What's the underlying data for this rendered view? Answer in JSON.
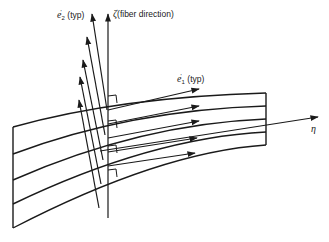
{
  "figure": {
    "type": "laminate fiber-coordinate diagram",
    "stroke_color": "#1a1a1a",
    "background": "#ffffff"
  },
  "labels": {
    "e2": {
      "symbol": "e",
      "superscript": "'",
      "subscript": "2",
      "suffix": "(typ)"
    },
    "zeta": {
      "symbol": "ζ",
      "suffix": "(fiber direction)"
    },
    "e1": {
      "symbol": "e",
      "superscript": "'",
      "subscript": "1",
      "suffix": "(typ)"
    },
    "eta": {
      "symbol": "η"
    }
  },
  "layers": {
    "count": 4,
    "interface_lines": 5
  }
}
